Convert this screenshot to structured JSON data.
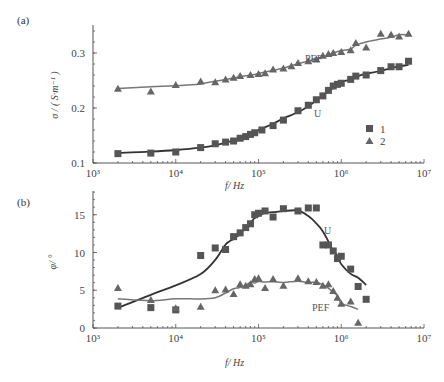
{
  "panels": {
    "a": {
      "label": "(a)",
      "ylabel": "σ / ( S·m⁻¹ )",
      "xlabel": "f/ Hz",
      "yticks": [
        "0.1",
        "0.2",
        "0.3"
      ],
      "curve_labels": {
        "PEF": "PEF",
        "U": "U"
      }
    },
    "b": {
      "label": "(b)",
      "ylabel": "φ/ °",
      "xlabel": "f/ Hz",
      "yticks": [
        "0",
        "5",
        "10",
        "15"
      ],
      "curve_labels": {
        "PEF": "PEF",
        "U": "U"
      }
    }
  },
  "xticks": [
    "10³",
    "10⁴",
    "10⁵",
    "10⁶",
    "10⁷"
  ],
  "legend": [
    {
      "marker": "square",
      "label": "1"
    },
    {
      "marker": "triangle",
      "label": "2"
    }
  ],
  "colors": {
    "series1": "#333333",
    "series1_marker": "#555555",
    "series2": "#777777",
    "series2_marker": "#666666",
    "axis": "#555555"
  },
  "chart_data": [
    {
      "type": "scatter",
      "title": "(a)",
      "xlabel": "f/ Hz",
      "ylabel": "σ / (S·m⁻¹)",
      "xscale": "log",
      "xlim": [
        1000,
        10000000
      ],
      "ylim": [
        0.1,
        0.35
      ],
      "xticks": [
        1000,
        10000,
        100000,
        1000000,
        10000000
      ],
      "yticks": [
        0.1,
        0.2,
        0.3
      ],
      "grid": false,
      "legend_position": "lower right",
      "series": [
        {
          "name": "1",
          "curve_label": "U",
          "marker": "square",
          "fit_line": true,
          "x": [
            2000,
            5000,
            10000,
            20000,
            30000,
            40000,
            50000,
            60000,
            70000,
            80000,
            90000,
            110000,
            150000,
            200000,
            300000,
            400000,
            500000,
            600000,
            700000,
            800000,
            900000,
            1000000,
            1300000,
            1500000,
            2000000,
            3000000,
            4000000,
            5000000,
            6500000
          ],
          "y": [
            0.117,
            0.118,
            0.12,
            0.128,
            0.135,
            0.138,
            0.14,
            0.145,
            0.148,
            0.152,
            0.155,
            0.16,
            0.168,
            0.178,
            0.195,
            0.205,
            0.215,
            0.222,
            0.232,
            0.24,
            0.243,
            0.245,
            0.252,
            0.258,
            0.26,
            0.268,
            0.275,
            0.275,
            0.285
          ]
        },
        {
          "name": "2",
          "curve_label": "PEF",
          "marker": "triangle",
          "fit_line": true,
          "x": [
            2000,
            5000,
            10000,
            20000,
            30000,
            40000,
            50000,
            60000,
            80000,
            100000,
            120000,
            150000,
            200000,
            250000,
            300000,
            400000,
            500000,
            600000,
            700000,
            800000,
            1000000,
            1300000,
            1500000,
            2000000,
            3000000,
            4000000,
            5000000,
            6500000
          ],
          "y": [
            0.235,
            0.23,
            0.242,
            0.248,
            0.247,
            0.252,
            0.255,
            0.258,
            0.26,
            0.262,
            0.263,
            0.27,
            0.272,
            0.276,
            0.282,
            0.285,
            0.288,
            0.295,
            0.298,
            0.3,
            0.302,
            0.305,
            0.318,
            0.31,
            0.335,
            0.333,
            0.33,
            0.335
          ]
        }
      ]
    },
    {
      "type": "scatter",
      "title": "(b)",
      "xlabel": "f/ Hz",
      "ylabel": "φ/ °",
      "xscale": "log",
      "xlim": [
        1000,
        10000000
      ],
      "ylim": [
        0,
        18
      ],
      "xticks": [
        1000,
        10000,
        100000,
        1000000,
        10000000
      ],
      "yticks": [
        0,
        5,
        10,
        15
      ],
      "grid": false,
      "series": [
        {
          "name": "1",
          "curve_label": "U",
          "marker": "square",
          "fit_line": true,
          "x": [
            2000,
            5000,
            10000,
            20000,
            30000,
            40000,
            50000,
            60000,
            70000,
            80000,
            90000,
            100000,
            120000,
            150000,
            200000,
            300000,
            400000,
            500000,
            600000,
            700000,
            800000,
            900000,
            1000000,
            1300000,
            1600000,
            2000000
          ],
          "y": [
            2.9,
            2.7,
            2.4,
            9.6,
            10.6,
            10.4,
            12.1,
            12.6,
            13.3,
            13.8,
            15.0,
            15.2,
            15.5,
            14.7,
            15.8,
            15.5,
            15.9,
            15.9,
            11.0,
            11.0,
            10.2,
            9.2,
            9.5,
            7.8,
            5.5,
            3.8
          ]
        },
        {
          "name": "2",
          "curve_label": "PEF",
          "marker": "triangle",
          "fit_line": true,
          "x": [
            2000,
            5000,
            10000,
            20000,
            30000,
            40000,
            50000,
            60000,
            70000,
            80000,
            90000,
            100000,
            120000,
            150000,
            200000,
            300000,
            400000,
            500000,
            600000,
            700000,
            800000,
            900000,
            1000000,
            1300000,
            1600000
          ],
          "y": [
            5.3,
            3.7,
            2.6,
            2.8,
            5.0,
            5.1,
            4.5,
            5.8,
            5.6,
            5.8,
            6.5,
            6.6,
            5.3,
            6.5,
            5.6,
            6.6,
            6.2,
            6.1,
            5.6,
            5.8,
            4.9,
            4.0,
            3.2,
            3.5,
            0.7
          ]
        }
      ]
    }
  ]
}
